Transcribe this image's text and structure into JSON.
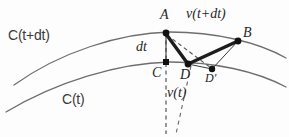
{
  "figure": {
    "type": "geometric-diagram",
    "background_color": "#fdfdfd",
    "stroke_color": "#2b2b2b",
    "curve_color": "#6e6e6e",
    "width": 289,
    "height": 137,
    "curves": [
      {
        "id": "curve-upper",
        "label": "C(t+dt)",
        "label_position": {
          "x": 8,
          "y": 28
        },
        "path": "M 14,85 C 60,52 120,33 170,32 C 215,32 258,42 286,58"
      },
      {
        "id": "curve-lower",
        "label": "C(t)",
        "label_position": {
          "x": 62,
          "y": 92
        },
        "path": "M 6,112 C 56,82 118,63 170,62 C 214,62 256,71 286,87"
      }
    ],
    "points": [
      {
        "id": "A",
        "label": "A",
        "x": 166,
        "y": 33,
        "label_x": 160,
        "label_y": 8,
        "marker": "filled-dot"
      },
      {
        "id": "B",
        "label": "B",
        "x": 238,
        "y": 41,
        "label_x": 243,
        "label_y": 26,
        "marker": "filled-dot"
      },
      {
        "id": "C",
        "label": "C",
        "x": 166,
        "y": 62,
        "label_x": 152,
        "label_y": 66,
        "marker": "filled-square"
      },
      {
        "id": "D",
        "label": "D",
        "x": 188,
        "y": 64,
        "label_x": 180,
        "label_y": 68,
        "marker": "filled-dot"
      },
      {
        "id": "Dp",
        "label": "D'",
        "x": 212,
        "y": 69,
        "label_x": 205,
        "label_y": 72,
        "marker": "filled-dot"
      }
    ],
    "segments": [
      {
        "id": "seg-A-D",
        "from": "A",
        "to": "D",
        "style": "thick-solid"
      },
      {
        "id": "seg-D-B",
        "from": "D",
        "to": "B",
        "style": "thick-solid"
      },
      {
        "id": "seg-A-C",
        "from": "A",
        "to": "C",
        "style": "thin-solid"
      },
      {
        "id": "seg-B-Dp",
        "from": "B",
        "to": "Dp",
        "style": "thin-solid"
      },
      {
        "id": "seg-D-Dp",
        "from": "D",
        "to": "Dp",
        "style": "thin-solid"
      },
      {
        "id": "seg-A-Dp",
        "from": "A",
        "to": "Dp",
        "style": "dashed"
      },
      {
        "id": "seg-C-down",
        "from": "C",
        "to": "below-C",
        "style": "dashed-vertical"
      },
      {
        "id": "seg-D-down",
        "from": "D",
        "to": "below-D",
        "style": "dashed-slant"
      }
    ],
    "annotations": [
      {
        "id": "ann-dt",
        "text": "dt",
        "x": 136,
        "y": 40,
        "style": "italic-serif",
        "describes": "distance between C(t) and C(t+dt) along AC"
      },
      {
        "id": "ann-v-t-dt",
        "text": "v(t+dt)",
        "x": 186,
        "y": 7,
        "style": "italic-serif",
        "describes": "velocity at time t+dt, along D to B"
      },
      {
        "id": "ann-v-t",
        "text": "v(t)",
        "x": 167,
        "y": 86,
        "style": "italic-serif",
        "describes": "velocity at time t, below C"
      }
    ]
  }
}
